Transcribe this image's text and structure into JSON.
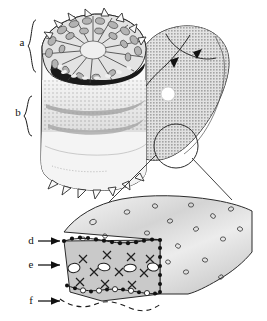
{
  "figure": {
    "background_color": "#ffffff",
    "ink_color": "#1a1a1a",
    "width": 267,
    "height": 321
  },
  "labels": [
    {
      "id": "a",
      "text": "a",
      "x": 22,
      "y": 46,
      "marker": "brace",
      "target": "upper-cell-zone"
    },
    {
      "id": "b",
      "text": "b",
      "x": 18,
      "y": 116,
      "marker": "brace",
      "target": "banded-zone"
    },
    {
      "id": "d",
      "text": "d",
      "x": 31,
      "y": 244,
      "marker": "arrow",
      "target": "dotted-upper-boundary"
    },
    {
      "id": "e",
      "text": "e",
      "x": 31,
      "y": 268,
      "marker": "arrow",
      "target": "cross-hatched-layer"
    },
    {
      "id": "f",
      "text": "f",
      "x": 31,
      "y": 304,
      "marker": "arrow",
      "target": "dashed-lower-boundary"
    }
  ],
  "braces": [
    {
      "for": "a",
      "x": 34,
      "y_top": 20,
      "y_bottom": 72
    },
    {
      "for": "b",
      "x": 30,
      "y_top": 96,
      "y_bottom": 136
    }
  ],
  "arrows": [
    {
      "for": "d",
      "x1": 38,
      "y1": 241,
      "x2": 62,
      "y2": 241
    },
    {
      "for": "e",
      "x1": 38,
      "y1": 265,
      "x2": 62,
      "y2": 265
    },
    {
      "for": "f",
      "x1": 38,
      "y1": 301,
      "x2": 62,
      "y2": 301
    }
  ],
  "panels": {
    "sectioned_organ": {
      "name": "sectioned-organ",
      "description": "Cut cylindrical organ showing radial cell pattern on the cut face and stippled bands below",
      "zones": [
        {
          "name": "radial-cell-face",
          "fill": "#d8d8d8",
          "label_ref": "a"
        },
        {
          "name": "dark-inner-ring",
          "fill": "#1a1a1a",
          "label_ref": "a"
        },
        {
          "name": "stippled-band-zone",
          "fill": "#bdbdbd",
          "label_ref": "b"
        },
        {
          "name": "pale-lower-zone",
          "fill": "#f2f2f2"
        }
      ],
      "spiky_margin": true
    },
    "whole_organ": {
      "name": "whole-organ",
      "description": "Intact organ rendered with dot-screen texture, internal ridge lines and two solid arrowheads",
      "fill": "#c2c2c2",
      "texture": "dot-screen",
      "white_dot": {
        "x": 168,
        "y": 94,
        "r": 7
      },
      "arrowheads": 2
    },
    "magnifier": {
      "name": "magnification-callout",
      "circle": {
        "x": 176,
        "y": 146,
        "r": 22
      },
      "leader_lines": 2
    },
    "tissue_detail": {
      "name": "tissue-detail",
      "description": "Enlarged wedge of tissue; upper surface stippled with small open circles, cut face shows X symbols and white lacunae bounded above by a row of black dots and below by a dashed outline",
      "surface_fill": "#d9d9d9",
      "cut_face_fill": "#c9c9c9",
      "symbols": {
        "black_dot_row": "d",
        "x_marks": "e",
        "white_lacunae": "e",
        "dashed_margin": "f"
      }
    }
  }
}
